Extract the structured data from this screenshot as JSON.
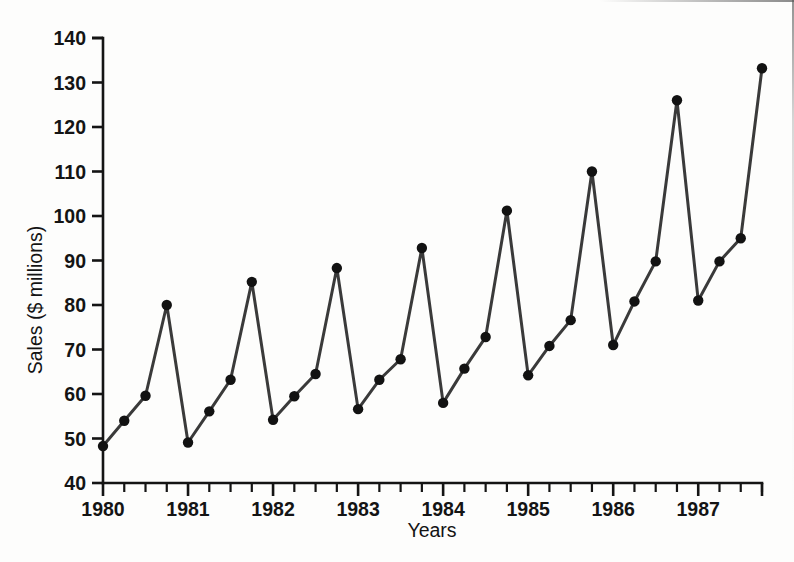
{
  "chart_data": {
    "type": "line",
    "title": "",
    "xlabel": "Years",
    "ylabel": "Sales ($ millions)",
    "ylim": [
      40,
      140
    ],
    "yticks": [
      40,
      50,
      60,
      70,
      80,
      90,
      100,
      110,
      120,
      130,
      140
    ],
    "ytick_labels": [
      "40",
      "50",
      "60",
      "70",
      "80",
      "90",
      "100",
      "110",
      "120",
      "130",
      "140"
    ],
    "xlim": [
      1980.0,
      1987.75
    ],
    "xtick_labels": [
      "1980",
      "1981",
      "1982",
      "1983",
      "1984",
      "1985",
      "1986",
      "1987"
    ],
    "x_minor_ticks_per_label": 4,
    "x_minor_tick_note": "quarterly tick marks; year label placed at first quarter of each year",
    "grid": false,
    "legend": null,
    "marker": "filled-circle",
    "line_color": "#3a3a3a",
    "marker_color": "#121212",
    "x": [
      "1980 Q1",
      "1980 Q2",
      "1980 Q3",
      "1980 Q4",
      "1981 Q1",
      "1981 Q2",
      "1981 Q3",
      "1981 Q4",
      "1982 Q1",
      "1982 Q2",
      "1982 Q3",
      "1982 Q4",
      "1983 Q1",
      "1983 Q2",
      "1983 Q3",
      "1983 Q4",
      "1984 Q1",
      "1984 Q2",
      "1984 Q3",
      "1984 Q4",
      "1985 Q1",
      "1985 Q2",
      "1985 Q3",
      "1985 Q4",
      "1986 Q1",
      "1986 Q2",
      "1986 Q3",
      "1986 Q4",
      "1987 Q1",
      "1987 Q2",
      "1987 Q3",
      "1987 Q4"
    ],
    "values": [
      48.3,
      54.0,
      59.6,
      80.0,
      49.1,
      56.1,
      63.2,
      85.2,
      54.2,
      59.5,
      64.5,
      88.3,
      56.6,
      63.2,
      67.8,
      92.8,
      58.0,
      65.7,
      72.8,
      101.2,
      64.2,
      70.8,
      76.6,
      110.0,
      71.0,
      80.8,
      89.8,
      126.0,
      81.0,
      89.8,
      95.0,
      133.2
    ],
    "series": [
      {
        "name": "Sales",
        "values": [
          48.3,
          54.0,
          59.6,
          80.0,
          49.1,
          56.1,
          63.2,
          85.2,
          54.2,
          59.5,
          64.5,
          88.3,
          56.6,
          63.2,
          67.8,
          92.8,
          58.0,
          65.7,
          72.8,
          101.2,
          64.2,
          70.8,
          76.6,
          110.0,
          71.0,
          80.8,
          89.8,
          126.0,
          81.0,
          89.8,
          95.0,
          133.2
        ]
      }
    ]
  },
  "axes": {
    "y_axis_label": "Sales ($ millions)",
    "x_axis_label": "Years"
  }
}
